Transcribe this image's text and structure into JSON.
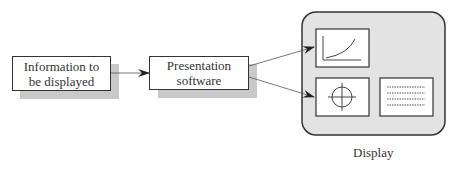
{
  "nodes": {
    "info": {
      "line1": "Information to",
      "line2": "be displayed"
    },
    "presentation": {
      "line1": "Presentation",
      "line2": "software"
    },
    "display": {
      "caption": "Display",
      "panels": [
        "graph-panel",
        "crosshair-panel",
        "text-lines-panel"
      ]
    }
  },
  "edges": [
    {
      "from": "info",
      "to": "presentation"
    },
    {
      "from": "presentation",
      "to": "display.graph-panel"
    },
    {
      "from": "presentation",
      "to": "display.crosshair-panel"
    }
  ],
  "colors": {
    "shadow": "#c9c9c9",
    "display_fill": "#e3e3e3",
    "stroke": "#333333"
  }
}
